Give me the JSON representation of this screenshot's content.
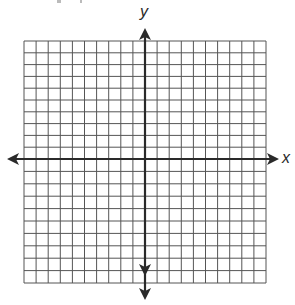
{
  "diagram": {
    "type": "coordinate-plane",
    "axes": {
      "x_label": "x",
      "y_label": "y"
    },
    "grid": {
      "columns": 20,
      "rows": 20,
      "left": 24,
      "top": 41,
      "right": 266,
      "bottom": 283,
      "origin_x": 145,
      "origin_y": 159,
      "line_color": "#555555",
      "axis_color": "#2a2a2a"
    },
    "arrows": {
      "x_left_tip": 7,
      "x_right_tip": 279,
      "y_top_tip": 28,
      "y_bottom_tips": [
        276,
        300
      ]
    }
  }
}
